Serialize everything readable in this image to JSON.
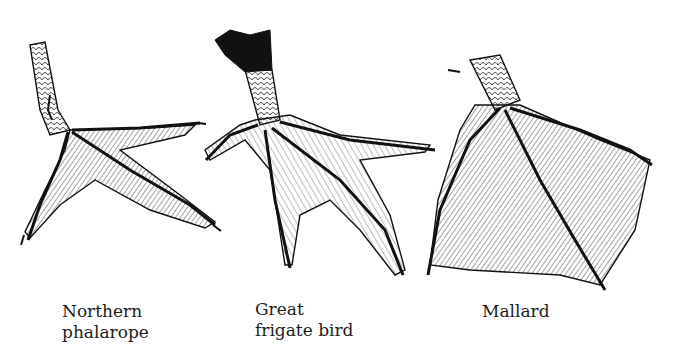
{
  "figure": {
    "type": "illustration",
    "panels": [
      {
        "id": "phalarope",
        "label_line1": "Northern",
        "label_line2": "phalarope",
        "foot_type": "lobed"
      },
      {
        "id": "frigate",
        "label_line1": "Great",
        "label_line2": "frigate bird",
        "foot_type": "partially webbed"
      },
      {
        "id": "mallard",
        "label_line1": "Mallard",
        "label_line2": "",
        "foot_type": "webbed"
      }
    ]
  }
}
